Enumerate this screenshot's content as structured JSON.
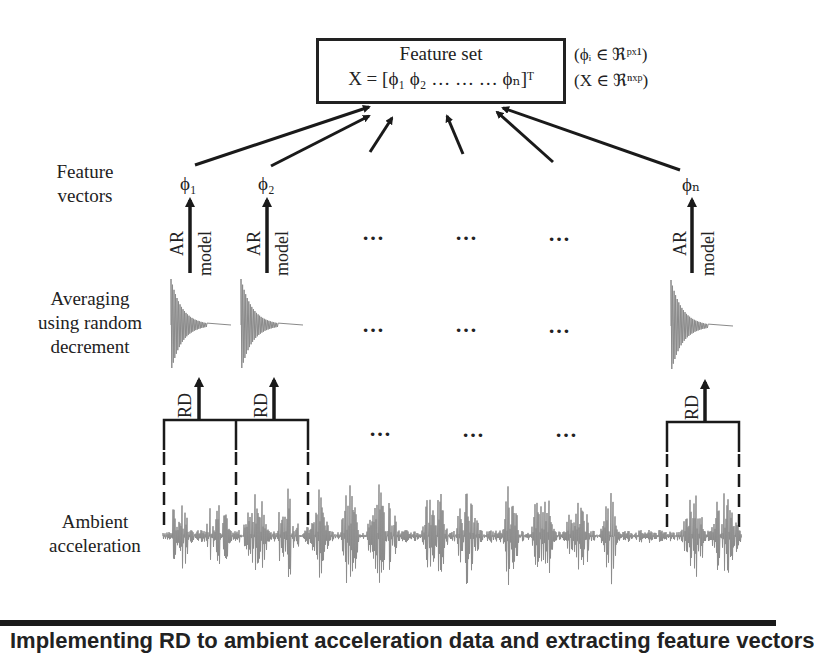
{
  "feature_set": {
    "title": "Feature set",
    "equation": "X = [ϕ₁  ϕ₂  …   …   …  ϕₙ]ᵀ",
    "annotation_phi": "(ϕᵢ ∈ ℜᵖˣ¹)",
    "annotation_x": "(X ∈ ℜⁿˣᵖ)"
  },
  "row_labels": {
    "feature_vectors_line1": "Feature",
    "feature_vectors_line2": "vectors",
    "averaging_line1": "Averaging",
    "averaging_line2": "using random",
    "averaging_line3": "decrement",
    "ambient_line1": "Ambient",
    "ambient_line2": "acceleration"
  },
  "vectors": {
    "phi_1": "ϕ₁",
    "phi_2": "ϕ₂",
    "phi_n": "ϕₙ"
  },
  "arrow_labels": {
    "ar": "AR",
    "model": "model",
    "rd": "RD"
  },
  "ellipsis": "…",
  "caption": "Implementing RD to ambient acceleration data and extracting feature vectors"
}
